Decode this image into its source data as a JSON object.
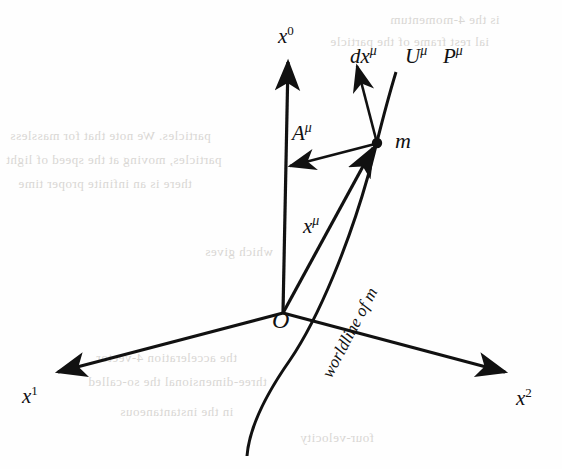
{
  "figure": {
    "kind": "spacetime-worldline-diagram",
    "background_color": "#fefefe",
    "ink_color": "#111111",
    "bleed_color": "#d9d7d4",
    "width": 562,
    "height": 469
  },
  "axes": [
    {
      "id": "x0",
      "label": "x",
      "superscript": "0",
      "label_x": 278,
      "label_y": 26,
      "from": [
        283,
        313
      ],
      "to": [
        288,
        62
      ],
      "arrow": true
    },
    {
      "id": "x1",
      "label": "x",
      "superscript": "1",
      "label_x": 22,
      "label_y": 386,
      "from": [
        283,
        313
      ],
      "to": [
        58,
        372
      ],
      "arrow": true
    },
    {
      "id": "x2",
      "label": "x",
      "superscript": "2",
      "label_x": 516,
      "label_y": 388,
      "from": [
        283,
        313
      ],
      "to": [
        505,
        372
      ],
      "arrow": true
    }
  ],
  "vectors": [
    {
      "id": "position",
      "label": "x",
      "mu": "μ",
      "label_x": 303,
      "label_y": 216,
      "from": [
        283,
        313
      ],
      "to": [
        373,
        148
      ],
      "arrow": true
    },
    {
      "id": "acceleration",
      "label": "A",
      "mu": "μ",
      "label_x": 292,
      "label_y": 123,
      "from": [
        375,
        144
      ],
      "to": [
        290,
        166
      ],
      "arrow": true
    },
    {
      "id": "tangent",
      "label": "dx",
      "mu": "μ",
      "label_x": 350,
      "label_y": 46,
      "from": [
        377,
        143
      ],
      "to": [
        357,
        66
      ],
      "arrow": true
    },
    {
      "id": "four-velocity",
      "label": "U",
      "mu": "μ",
      "label_x": 405,
      "label_y": 46
    },
    {
      "id": "four-momentum",
      "label": "P",
      "mu": "μ",
      "label_x": 443,
      "label_y": 46
    }
  ],
  "points": [
    {
      "id": "particle",
      "label": "m",
      "label_x": 395,
      "label_y": 130,
      "x": 377,
      "y": 143,
      "r": 5
    },
    {
      "id": "origin",
      "label": "O",
      "label_x": 272,
      "label_y": 308,
      "x": 283,
      "y": 313
    }
  ],
  "curve": {
    "id": "worldline",
    "label": "worldline of m",
    "label_x": 318,
    "label_y": 372,
    "path": "M 247 456 C 249 430 262 400 290 360 C 320 316 350 240 368 176 C 375 152 382 118 396 72"
  },
  "bleed_text": [
    {
      "text": "is the 4-momentum",
      "x": 390,
      "y": 12,
      "size": 13
    },
    {
      "text": "ial rest frame of the particle",
      "x": 330,
      "y": 34,
      "size": 13
    },
    {
      "text": "particles. We note that for massless",
      "x": 10,
      "y": 128,
      "size": 13
    },
    {
      "text": "particles, moving at the speed of light",
      "x": 6,
      "y": 152,
      "size": 13
    },
    {
      "text": "there is an infinite proper time",
      "x": 18,
      "y": 176,
      "size": 13
    },
    {
      "text": "which gives",
      "x": 205,
      "y": 244,
      "size": 13
    },
    {
      "text": "the acceleration 4-vector",
      "x": 96,
      "y": 350,
      "size": 13
    },
    {
      "text": "three-dimensional the so-called",
      "x": 88,
      "y": 374,
      "size": 13
    },
    {
      "text": "in the instantaneous",
      "x": 120,
      "y": 404,
      "size": 13
    },
    {
      "text": "four-velocity",
      "x": 300,
      "y": 430,
      "size": 13
    }
  ]
}
